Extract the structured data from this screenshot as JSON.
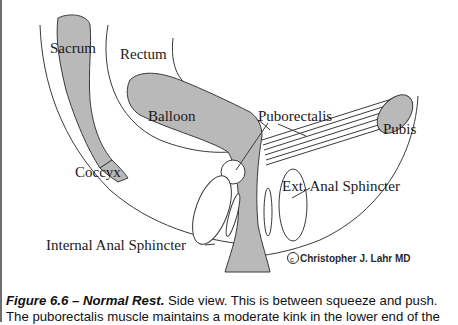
{
  "figure": {
    "labels": {
      "sacrum": "Sacrum",
      "rectum": "Rectum",
      "balloon": "Balloon",
      "puborectalis": "Puborectalis",
      "pubis": "Pubis",
      "coccyx": "Coccyx",
      "ext_anal_sphincter": "Ext. Anal Sphincter",
      "internal_anal_sphincter": "Internal Anal Sphincter",
      "copyright_symbol": "c",
      "copyright_author": "Christopher J. Lahr MD"
    },
    "colors": {
      "tissue_fill": "#b9b9b9",
      "outline": "#3a3a3a",
      "background": "#ffffff",
      "frame_border": "#6f6f6f"
    }
  },
  "caption": {
    "figure_title": "Figure 6.6 – Normal Rest.",
    "line1_text": " Side view. This is between squeeze and push.",
    "line2_text": "The puborectalis muscle maintains a moderate kink in the lower end of the"
  }
}
